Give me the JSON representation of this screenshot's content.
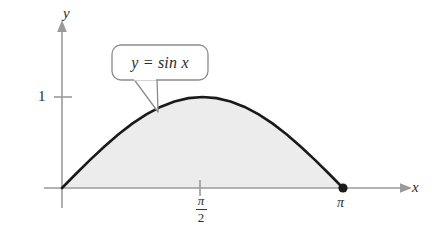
{
  "figure": {
    "name": "sine-area-figure",
    "background_color": "#ffffff"
  },
  "axes": {
    "x_label": "x",
    "y_label": "y",
    "axis_color": "#9a9a9a",
    "origin_px": [
      62,
      188
    ]
  },
  "ticks": {
    "y": [
      {
        "label": "1",
        "value": 1
      }
    ],
    "x": [
      {
        "label_numerator": "π",
        "label_denominator": "2",
        "label": "π/2",
        "value": 1.5708
      },
      {
        "label": "π",
        "value": 3.14159
      }
    ]
  },
  "callout": {
    "text": "y = sin x",
    "border_color": "#8c8c8c",
    "fill_color": "#ffffff"
  },
  "markers": [
    {
      "name": "endpoint-dot",
      "label": "π",
      "x": 3.14159,
      "y": 0,
      "color": "#1a1a1a"
    }
  ],
  "chart_data": {
    "type": "area",
    "title": "",
    "subtitle": "",
    "xlabel": "x",
    "ylabel": "y",
    "xlim": [
      0,
      3.4
    ],
    "ylim": [
      0,
      1.25
    ],
    "grid": false,
    "legend": null,
    "curve_color": "#1a1a1a",
    "fill_color": "#ececec",
    "annotations": [
      {
        "text": "y = sin x",
        "type": "callout",
        "points_to_x": 0.9
      },
      {
        "text": "π",
        "type": "point-label",
        "x": 3.14159,
        "y": 0
      }
    ],
    "xticks": [
      1.5708,
      3.14159
    ],
    "xticklabels": [
      "π/2",
      "π"
    ],
    "yticks": [
      1
    ],
    "yticklabels": [
      "1"
    ],
    "series": [
      {
        "name": "y = sin x",
        "x": [
          0,
          0.15708,
          0.31416,
          0.47124,
          0.62832,
          0.7854,
          0.94248,
          1.09956,
          1.25664,
          1.41372,
          1.5708,
          1.72788,
          1.88496,
          2.04204,
          2.19911,
          2.35619,
          2.51327,
          2.67035,
          2.82743,
          2.98451,
          3.14159
        ],
        "y": [
          0,
          0.1564,
          0.309,
          0.454,
          0.5878,
          0.7071,
          0.809,
          0.891,
          0.9511,
          0.9877,
          1.0,
          0.9877,
          0.9511,
          0.891,
          0.809,
          0.7071,
          0.5878,
          0.454,
          0.309,
          0.1564,
          0
        ]
      }
    ],
    "fill_between": {
      "series": "y = sin x",
      "from_y": 0,
      "x_range": [
        0,
        3.14159
      ]
    }
  }
}
